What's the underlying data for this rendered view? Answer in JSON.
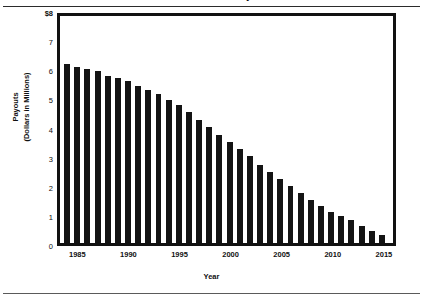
{
  "figure": {
    "title_clipped": "Estimated Annual Payouts",
    "xlabel": "Year",
    "ylabel_line1": "Payouts",
    "ylabel_line2": "(Dollars in Millions)",
    "frame_color": "#111111",
    "bar_color": "#141414"
  },
  "chart_data": {
    "type": "bar",
    "title": "Estimated Annual Payouts",
    "xlabel": "Year",
    "ylabel": "Payouts (Dollars in Millions)",
    "ylim": [
      0,
      8
    ],
    "ytick_labels": [
      "$8",
      "7",
      "6",
      "5",
      "4",
      "3",
      "2",
      "1",
      "0"
    ],
    "ytick_values": [
      8,
      7,
      6,
      5,
      4,
      3,
      2,
      1,
      0
    ],
    "xtick_labels": [
      "1985",
      "1990",
      "1995",
      "2000",
      "2005",
      "2010",
      "2015"
    ],
    "xtick_values": [
      1985,
      1990,
      1995,
      2000,
      2005,
      2010,
      2015
    ],
    "grid": false,
    "legend": "none",
    "categories": [
      1984,
      1985,
      1986,
      1987,
      1988,
      1989,
      1990,
      1991,
      1992,
      1993,
      1994,
      1995,
      1996,
      1997,
      1998,
      1999,
      2000,
      2001,
      2002,
      2003,
      2004,
      2005,
      2006,
      2007,
      2008,
      2009,
      2010,
      2011,
      2012,
      2013,
      2014,
      2015
    ],
    "values": [
      6.3,
      6.2,
      6.15,
      6.05,
      5.9,
      5.8,
      5.7,
      5.55,
      5.4,
      5.25,
      5.05,
      4.85,
      4.6,
      4.35,
      4.1,
      3.8,
      3.55,
      3.3,
      3.05,
      2.75,
      2.5,
      2.25,
      2.0,
      1.75,
      1.5,
      1.3,
      1.1,
      0.95,
      0.8,
      0.6,
      0.42,
      0.3
    ]
  }
}
